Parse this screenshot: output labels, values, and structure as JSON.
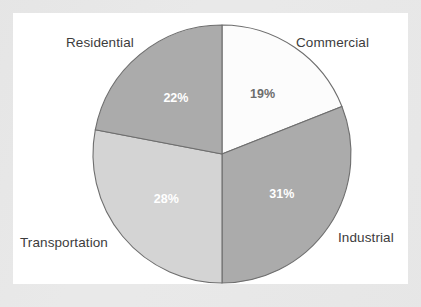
{
  "chart_data": {
    "type": "pie",
    "title": "",
    "subtitle": "",
    "xlabel": "",
    "ylabel": "",
    "legend_position": "none",
    "grid": false,
    "unit": "%",
    "start_angle_deg": 0,
    "direction": "clockwise",
    "categories": [
      "Commercial",
      "Industrial",
      "Transportation",
      "Residential"
    ],
    "values": [
      19,
      31,
      28,
      22
    ],
    "slices": [
      {
        "label": "Commercial",
        "value": 19,
        "value_label": "19%",
        "color": "#fcfcfc",
        "text_color": "#6d6d6d",
        "start_deg": 0,
        "end_deg": 68.4
      },
      {
        "label": "Industrial",
        "value": 31,
        "value_label": "31%",
        "color": "#ababab",
        "text_color": "#ffffff",
        "start_deg": 68.4,
        "end_deg": 180.0
      },
      {
        "label": "Transportation",
        "value": 28,
        "value_label": "28%",
        "color": "#d4d4d4",
        "text_color": "#ffffff",
        "start_deg": 180.0,
        "end_deg": 280.8
      },
      {
        "label": "Residential",
        "value": 22,
        "value_label": "22%",
        "color": "#ababab",
        "text_color": "#ffffff",
        "start_deg": 280.8,
        "end_deg": 360.0
      }
    ]
  },
  "labels": {
    "residential": "Residential",
    "commercial": "Commercial",
    "transportation": "Transportation",
    "industrial": "Industrial"
  },
  "percent_labels": {
    "commercial": "19%",
    "industrial": "31%",
    "transportation": "28%",
    "residential": "22%"
  },
  "colors": {
    "page_background": "#e9e9e9",
    "panel_background": "#ffffff",
    "slice_medium_gray": "#ababab",
    "slice_light_gray": "#d4d4d4",
    "slice_white": "#fcfcfc",
    "slice_outline": "#6e6e6e",
    "label_text": "#3c3c3c",
    "percent_dark_text": "#6d6d6d",
    "percent_light_text": "#ffffff"
  },
  "geometry": {
    "center_x": 209,
    "center_y": 141,
    "radius": 129
  }
}
